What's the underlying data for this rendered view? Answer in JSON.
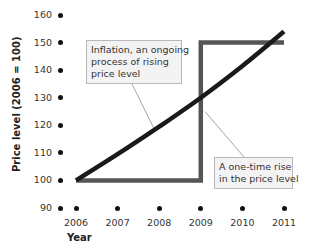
{
  "chart_data": {
    "type": "line",
    "title": "",
    "xlabel": "Year",
    "ylabel": "Price level (2006 = 100)",
    "x": [
      2006,
      2007,
      2008,
      2009,
      2010,
      2011
    ],
    "xticks": [
      "2006",
      "2007",
      "2008",
      "2009",
      "2010",
      "2011"
    ],
    "yticks": [
      "90",
      "100",
      "110",
      "120",
      "130",
      "140",
      "150",
      "160"
    ],
    "ylim": [
      90,
      160
    ],
    "xlim": [
      2006,
      2011
    ],
    "grid": false,
    "series": [
      {
        "name": "Inflation, an ongoing process of rising price level",
        "color": "#1a1a1a",
        "style": "curve",
        "x": [
          2006,
          2007,
          2008,
          2009,
          2010,
          2011
        ],
        "values": [
          100,
          109.5,
          119.5,
          130,
          141.5,
          154
        ]
      },
      {
        "name": "A one-time rise in the price level",
        "color": "#555555",
        "style": "step",
        "x": [
          2006,
          2009,
          2009,
          2011
        ],
        "values": [
          100,
          100,
          150,
          150
        ]
      }
    ],
    "annotations": [
      {
        "id": "inflation",
        "lines": [
          "Inflation, an ongoing",
          "process of rising",
          "price level"
        ],
        "points_to": {
          "x": 2007.9,
          "y": 118
        }
      },
      {
        "id": "one-time",
        "lines": [
          "A one-time rise",
          "in the price level"
        ],
        "points_to": {
          "x": 2009.1,
          "y": 125
        }
      }
    ]
  },
  "colors": {
    "inflation_line": "#1a1a1a",
    "step_line": "#555555",
    "callout_bg": "#f3f3f3",
    "callout_border": "#b8b8b8",
    "leader": "#9a9a9a"
  }
}
